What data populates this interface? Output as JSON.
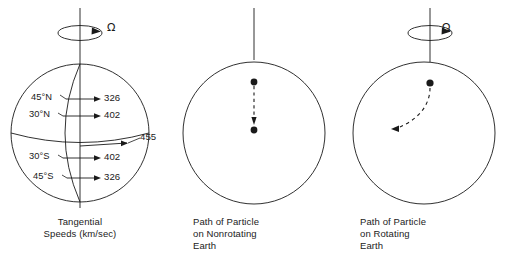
{
  "figure": {
    "background_color": "#ffffff",
    "stroke_color": "#1a1a1a",
    "panels": [
      {
        "id": "tangential-speeds",
        "caption": "Tangential\nSpeeds (km/sec)",
        "rotation_symbol": "Ω",
        "has_rotation_arrow": true,
        "latitude_labels": [
          {
            "label": "45°N",
            "speed": "326"
          },
          {
            "label": "30°N",
            "speed": "402"
          },
          {
            "label": "Equator",
            "speed": "455"
          },
          {
            "label": "30°S",
            "speed": "402"
          },
          {
            "label": "45°S",
            "speed": "326"
          }
        ],
        "speed_units": "km/sec"
      },
      {
        "id": "nonrotating-earth",
        "caption": "Path of Particle\non Nonrotating\nEarth",
        "rotation_symbol": "",
        "has_rotation_arrow": false,
        "path_type": "straight-dashed",
        "path_direction": "downward"
      },
      {
        "id": "rotating-earth",
        "caption": "Path of Particle\non Rotating\nEarth",
        "rotation_symbol": "Ω",
        "has_rotation_arrow": true,
        "path_type": "curved-dashed",
        "path_direction": "deflected-left"
      }
    ]
  }
}
